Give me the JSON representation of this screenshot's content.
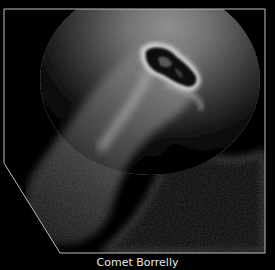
{
  "image": {
    "subject": "comet nucleus with coma and jets",
    "caption": "Comet Borrelly",
    "frame_color": "#bdbdbd",
    "background_color": "#000000"
  }
}
